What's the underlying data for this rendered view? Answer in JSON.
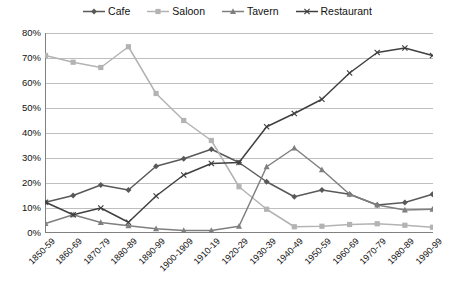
{
  "legend": {
    "position": "top-center",
    "items": [
      {
        "label": "Cafe",
        "color": "#595959",
        "marker": "diamond"
      },
      {
        "label": "Saloon",
        "color": "#b3b3b3",
        "marker": "square"
      },
      {
        "label": "Tavern",
        "color": "#7f7f7f",
        "marker": "triangle"
      },
      {
        "label": "Restaurant",
        "color": "#404040",
        "marker": "cross"
      }
    ]
  },
  "axes": {
    "y_ticks": [
      "0%",
      "10%",
      "20%",
      "30%",
      "40%",
      "50%",
      "60%",
      "70%",
      "80%"
    ],
    "x_ticks": [
      "1850-59",
      "1860-69",
      "1870-79",
      "1880-89",
      "1890-99",
      "1900-1909",
      "1910-19",
      "1920-29",
      "1930-39",
      "1940-49",
      "1950-59",
      "1960-69",
      "1970-79",
      "1980-89",
      "1990-99"
    ]
  },
  "style": {
    "gridline_color": "#bfbfbf",
    "axis_color": "#808080",
    "plot_background": "#ffffff"
  },
  "chart_data": {
    "type": "line",
    "title": "",
    "xlabel": "",
    "ylabel": "",
    "ylim": [
      0,
      80
    ],
    "y_tick_step": 10,
    "grid": true,
    "legend_position": "top-center",
    "categories": [
      "1850-59",
      "1860-69",
      "1870-79",
      "1880-89",
      "1890-99",
      "1900-1909",
      "1910-19",
      "1920-29",
      "1930-39",
      "1940-49",
      "1950-59",
      "1960-69",
      "1970-79",
      "1980-89",
      "1990-99"
    ],
    "series": [
      {
        "name": "Cafe",
        "color": "#595959",
        "marker": "diamond",
        "values": [
          12.3,
          15.0,
          19.2,
          17.2,
          26.7,
          29.7,
          33.5,
          28.2,
          20.5,
          14.5,
          17.2,
          15.5,
          11.2,
          12.2,
          15.5
        ]
      },
      {
        "name": "Saloon",
        "color": "#b3b3b3",
        "marker": "square",
        "values": [
          71.0,
          68.3,
          66.2,
          74.5,
          55.8,
          45.0,
          37.0,
          18.5,
          9.5,
          2.5,
          2.7,
          3.4,
          3.7,
          3.1,
          2.3
        ]
      },
      {
        "name": "Tavern",
        "color": "#7f7f7f",
        "marker": "triangle",
        "values": [
          3.8,
          7.3,
          4.2,
          2.9,
          1.7,
          1.0,
          1.0,
          2.7,
          26.5,
          34.0,
          25.3,
          15.5,
          11.2,
          9.2,
          9.5
        ]
      },
      {
        "name": "Restaurant",
        "color": "#404040",
        "marker": "cross",
        "values": [
          12.3,
          7.3,
          10.0,
          4.3,
          14.8,
          23.2,
          27.8,
          28.2,
          42.5,
          47.8,
          53.5,
          64.0,
          72.2,
          74.0,
          71.0
        ]
      }
    ]
  }
}
